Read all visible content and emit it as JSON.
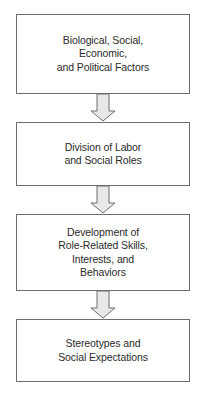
{
  "diagram": {
    "type": "vertical-flowchart",
    "colors": {
      "background": "#ffffff",
      "box_border": "#6e6e6e",
      "box_fill": "#ffffff",
      "text": "#2b2b2b",
      "arrow_fill": "#e8e8e8",
      "arrow_stroke": "#6e6e6e"
    },
    "nodes": [
      {
        "id": "node-1",
        "label": "Biological, Social,\nEconomic,\nand Political Factors",
        "lines": [
          "Biological, Social,",
          "Economic,",
          "and Political Factors"
        ]
      },
      {
        "id": "node-2",
        "label": "Division of Labor\nand Social Roles",
        "lines": [
          "Division of Labor",
          "and Social Roles"
        ]
      },
      {
        "id": "node-3",
        "label": "Development of\nRole-Related Skills,\nInterests, and\nBehaviors",
        "lines": [
          "Development of",
          "Role-Related Skills,",
          "Interests, and",
          "Behaviors"
        ]
      },
      {
        "id": "node-4",
        "label": "Stereotypes and\nSocial Expectations",
        "lines": [
          "Stereotypes and",
          "Social Expectations"
        ]
      }
    ],
    "connectors": [
      {
        "id": "connector-1",
        "from": "node-1",
        "to": "node-2",
        "shape": "block-arrow-down"
      },
      {
        "id": "connector-2",
        "from": "node-2",
        "to": "node-3",
        "shape": "block-arrow-down"
      },
      {
        "id": "connector-3",
        "from": "node-3",
        "to": "node-4",
        "shape": "block-arrow-down"
      }
    ]
  }
}
